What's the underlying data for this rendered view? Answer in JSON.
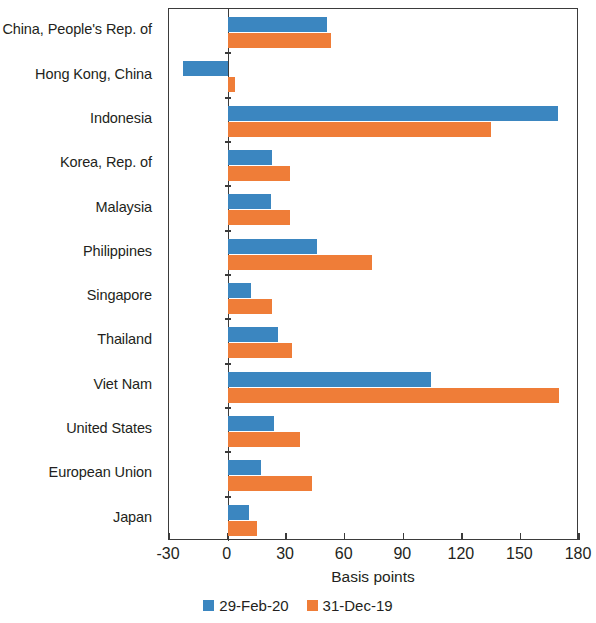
{
  "chart_data": {
    "type": "bar",
    "orientation": "horizontal",
    "title": "",
    "xlabel": "Basis points",
    "ylabel": "",
    "xlim": [
      -30,
      180
    ],
    "xticks": [
      -30,
      0,
      30,
      60,
      90,
      120,
      150,
      180
    ],
    "xtick_labels": [
      "-30",
      "0",
      "30",
      "60",
      "90",
      "120",
      "150",
      "180"
    ],
    "grid": false,
    "legend_position": "bottom",
    "categories": [
      "China, People's Rep. of",
      "Hong Kong, China",
      "Indonesia",
      "Korea, Rep. of",
      "Malaysia",
      "Philippines",
      "Singapore",
      "Thailand",
      "Viet Nam",
      "United States",
      "European Union",
      "Japan"
    ],
    "series": [
      {
        "name": "29-Feb-20",
        "color": "#3b86c0",
        "values": [
          51,
          -23,
          169,
          23,
          22,
          46,
          12,
          26,
          104,
          24,
          17,
          11
        ]
      },
      {
        "name": "31-Dec-19",
        "color": "#ef7d38",
        "values": [
          53,
          4,
          135,
          32,
          32,
          74,
          23,
          33,
          170,
          37,
          43,
          15
        ]
      }
    ]
  }
}
